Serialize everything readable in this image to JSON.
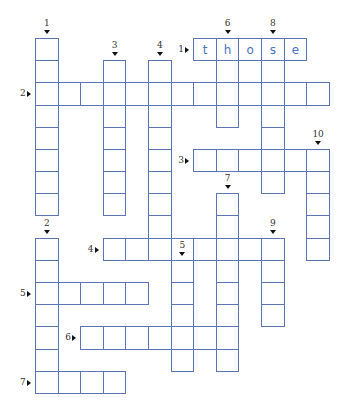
{
  "puzzle": {
    "grid": {
      "origin_x": 35,
      "origin_y": 38,
      "col_step": 22.6,
      "row_step": 22.18
    },
    "across": [
      {
        "number": "1",
        "row": 0,
        "col": 7,
        "length": 5,
        "answer": "those"
      },
      {
        "number": "2",
        "row": 2,
        "col": 0,
        "length": 13,
        "answer": ""
      },
      {
        "number": "3",
        "row": 5,
        "col": 7,
        "length": 6,
        "answer": ""
      },
      {
        "number": "4",
        "row": 9,
        "col": 3,
        "length": 8,
        "answer": ""
      },
      {
        "number": "5",
        "row": 11,
        "col": 0,
        "length": 5,
        "answer": ""
      },
      {
        "number": "6",
        "row": 13,
        "col": 2,
        "length": 7,
        "answer": ""
      },
      {
        "number": "7",
        "row": 15,
        "col": 0,
        "length": 4,
        "answer": ""
      }
    ],
    "down": [
      {
        "number": "1",
        "row": 0,
        "col": 0,
        "length": 8,
        "answer": ""
      },
      {
        "number": "2",
        "row": 9,
        "col": 0,
        "length": 7,
        "answer": ""
      },
      {
        "number": "3",
        "row": 1,
        "col": 3,
        "length": 7,
        "answer": ""
      },
      {
        "number": "4",
        "row": 1,
        "col": 5,
        "length": 9,
        "answer": ""
      },
      {
        "number": "5",
        "row": 10,
        "col": 6,
        "length": 5,
        "answer": ""
      },
      {
        "number": "6",
        "row": 0,
        "col": 8,
        "length": 4,
        "answer": ""
      },
      {
        "number": "7",
        "row": 7,
        "col": 8,
        "length": 8,
        "answer": ""
      },
      {
        "number": "8",
        "row": 0,
        "col": 10,
        "length": 7,
        "answer": ""
      },
      {
        "number": "9",
        "row": 9,
        "col": 10,
        "length": 4,
        "answer": ""
      },
      {
        "number": "10",
        "row": 5,
        "col": 12,
        "length": 5,
        "answer": ""
      }
    ]
  },
  "colors": {
    "cell_border": "#5a74b6",
    "letter": "#4a72c4",
    "label": "#333333"
  }
}
